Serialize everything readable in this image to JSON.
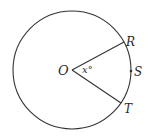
{
  "figure": {
    "type": "circle-central-angle",
    "center": {
      "label": "O",
      "x": 72,
      "y": 70
    },
    "radius": 59,
    "angle_label": "x°",
    "points": [
      {
        "label": "R",
        "x": 124,
        "y": 42
      },
      {
        "label": "S",
        "x": 131,
        "y": 71
      },
      {
        "label": "T",
        "x": 121,
        "y": 103
      }
    ],
    "stroke_color": "#333333"
  },
  "labels": {
    "center": "O",
    "angle": "x°",
    "r": "R",
    "s": "S",
    "t": "T"
  }
}
